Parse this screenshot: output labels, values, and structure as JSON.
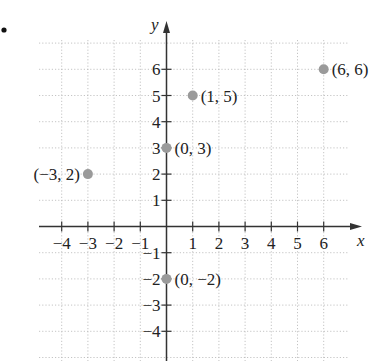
{
  "bullet": "•",
  "chart_data": {
    "type": "scatter",
    "title": "",
    "xlabel": "x",
    "ylabel": "y",
    "xlim": [
      -5,
      7
    ],
    "ylim": [
      -5,
      7
    ],
    "grid": true,
    "x_ticks": [
      -4,
      -3,
      -2,
      -1,
      1,
      2,
      3,
      4,
      5,
      6
    ],
    "x_tick_labels": [
      "−4",
      "−3",
      "−2",
      "−1",
      "1",
      "2",
      "3",
      "4",
      "5",
      "6"
    ],
    "y_ticks": [
      6,
      5,
      4,
      3,
      2,
      1,
      -1,
      -2,
      -3,
      -4
    ],
    "y_tick_labels": [
      "6",
      "5",
      "4",
      "3",
      "2",
      "1",
      "−1",
      "−2",
      "−3",
      "−4"
    ],
    "points": [
      {
        "x": -3,
        "y": 2,
        "label": "(−3, 2)",
        "label_side": "left"
      },
      {
        "x": 0,
        "y": 3,
        "label": "(0, 3)",
        "label_side": "right"
      },
      {
        "x": 1,
        "y": 5,
        "label": "(1, 5)",
        "label_side": "right"
      },
      {
        "x": 6,
        "y": 6,
        "label": "(6, 6)",
        "label_side": "right"
      },
      {
        "x": 0,
        "y": -2,
        "label": "(0, −2)",
        "label_side": "right"
      }
    ],
    "point_color": "#9a9a9a",
    "axis_color": "#333333",
    "grid_color": "#b5b5b5"
  }
}
